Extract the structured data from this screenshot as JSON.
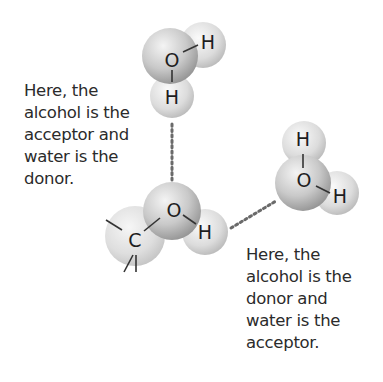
{
  "diagram": {
    "molecules": {
      "top_water": {
        "atoms": [
          "O",
          "H",
          "H"
        ]
      },
      "alcohol": {
        "atoms": [
          "C",
          "O",
          "H"
        ]
      },
      "right_water": {
        "atoms": [
          "H",
          "O",
          "H"
        ]
      }
    },
    "captions": {
      "left": [
        "Here, the",
        "alcohol is the",
        "acceptor and",
        "water is the",
        "donor."
      ],
      "right": [
        "Here, the",
        "alcohol is the",
        "donor and",
        "water is the",
        "acceptor."
      ]
    },
    "colors": {
      "text": "#2b2b2b",
      "sphere_light": "#f2f2f2",
      "sphere_dark": "#9a9a9a",
      "bond": "#333333",
      "hbond_dots": "#6a6a6a"
    }
  }
}
